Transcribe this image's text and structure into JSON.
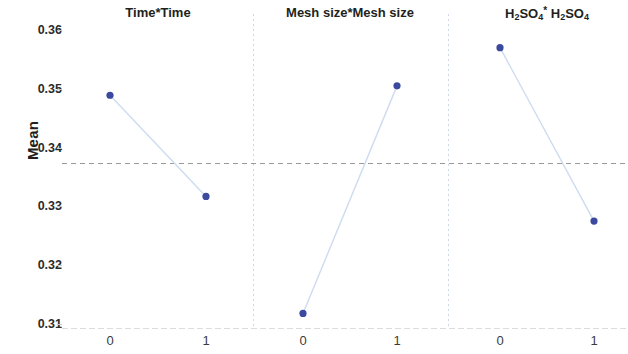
{
  "chart_data": {
    "type": "line",
    "title": "",
    "ylabel": "Mean",
    "xlabel": "",
    "ylim": [
      0.3062,
      0.3638
    ],
    "yticks": [
      0.36,
      0.35,
      0.34,
      0.33,
      0.32,
      0.31
    ],
    "ytick_labels": [
      "0.36",
      "0.35",
      "0.34",
      "0.33",
      "0.32",
      "0.31"
    ],
    "grid": false,
    "legend_position": "none",
    "reference_line": 0.3373,
    "marker_color": "#3b4a9e",
    "line_color": "#cddcf0",
    "reference_line_color": "#9a9a9a",
    "panels": [
      {
        "title": "Time*Time",
        "title_html": "Time*Time",
        "categories": [
          "0",
          "1"
        ],
        "values": [
          0.3489,
          0.3317
        ]
      },
      {
        "title": "Mesh size*Mesh size",
        "title_html": "Mesh size*Mesh size",
        "categories": [
          "0",
          "1"
        ],
        "values": [
          0.3118,
          0.3505
        ]
      },
      {
        "title": "H2SO4* H2SO4",
        "title_html": "H<sub>2</sub>SO<sub>4</sub><sup>*</sup> H<sub>2</sub>SO<sub>4</sub>",
        "categories": [
          "0",
          "1"
        ],
        "values": [
          0.357,
          0.3275
        ]
      }
    ]
  }
}
